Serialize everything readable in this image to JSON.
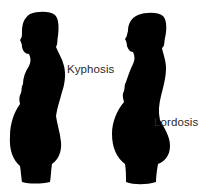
{
  "diagram": {
    "figures": [
      {
        "id": "left",
        "label": "Kyphosis",
        "color": "#000000"
      },
      {
        "id": "right",
        "label": "Lordosis",
        "color": "#000000"
      }
    ],
    "background": "#ffffff"
  }
}
